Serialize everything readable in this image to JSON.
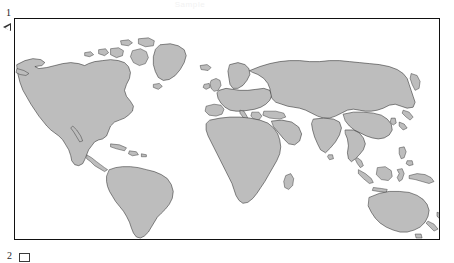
{
  "page": {
    "kind": "scanned-world-map-figure",
    "background_color": "#ffffff"
  },
  "watermark": {
    "text": "Sample",
    "color": "#f2f2f2"
  },
  "margin_marker": {
    "number": "1",
    "icon": "left-triangle-icon"
  },
  "bottom_marks": {
    "number": "2",
    "icon": "rectangle-glyph-icon"
  },
  "map": {
    "title": "World Map",
    "projection": "equirectangular",
    "land_fill_color": "#bdbdbd",
    "land_stroke_color": "#2b2b2b",
    "ocean_color": "#ffffff",
    "frame_color": "#111111",
    "regions": [
      "North America",
      "Greenland",
      "Canadian Arctic Archipelago",
      "Central America",
      "Caribbean",
      "South America",
      "Europe",
      "Scandinavia",
      "British Isles",
      "Africa",
      "Madagascar",
      "Middle East",
      "Arabian Peninsula",
      "Russia / Siberia",
      "India",
      "Sri Lanka",
      "China",
      "Japan",
      "Korea",
      "Southeast Asia",
      "Indonesia",
      "Philippines",
      "New Guinea",
      "Australia",
      "New Zealand",
      "Iceland"
    ]
  }
}
